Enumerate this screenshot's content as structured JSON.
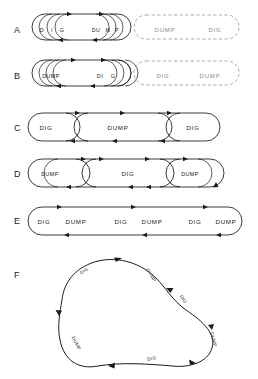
{
  "figure": {
    "background_color": "#ffffff",
    "ink_color": "#1a1a1a",
    "ghost_color": "#9a9a9a",
    "width": 258,
    "height": 379
  },
  "rows": [
    {
      "id": "A",
      "label": "A",
      "label_y": 30,
      "style": "nested-tight-with-ghost",
      "solid_labels": [
        {
          "text": "D",
          "x": 42,
          "y": 30
        },
        {
          "text": "I",
          "x": 52,
          "y": 30
        },
        {
          "text": "G",
          "x": 62,
          "y": 30
        },
        {
          "text": "DU",
          "x": 96,
          "y": 30
        },
        {
          "text": "M",
          "x": 108,
          "y": 30
        },
        {
          "text": "P",
          "x": 117,
          "y": 30
        }
      ],
      "ghost_labels": [
        {
          "text": "DUMP",
          "x": 143,
          "y": 30
        },
        {
          "text": "DIG",
          "x": 215,
          "y": 30
        }
      ]
    },
    {
      "id": "B",
      "label": "B",
      "label_y": 76,
      "style": "nested-tight-with-ghost",
      "solid_labels": [
        {
          "text": "DUMP",
          "x": 38,
          "y": 76
        },
        {
          "text": "DI",
          "x": 97,
          "y": 76
        },
        {
          "text": "G",
          "x": 112,
          "y": 76
        }
      ],
      "ghost_labels": [
        {
          "text": "DIG",
          "x": 143,
          "y": 76
        },
        {
          "text": "DUMP",
          "x": 205,
          "y": 76
        }
      ]
    },
    {
      "id": "C",
      "label": "C",
      "label_y": 128,
      "style": "nested-wide",
      "solid_labels": [
        {
          "text": "DIG",
          "x": 41,
          "y": 128
        },
        {
          "text": "DUMP",
          "x": 109,
          "y": 128
        },
        {
          "text": "DIG",
          "x": 189,
          "y": 128
        }
      ],
      "ghost_labels": []
    },
    {
      "id": "D",
      "label": "D",
      "label_y": 174,
      "style": "nested-wide",
      "solid_labels": [
        {
          "text": "DUMP",
          "x": 41,
          "y": 174
        },
        {
          "text": "DIG",
          "x": 112,
          "y": 174
        },
        {
          "text": "DUMP",
          "x": 182,
          "y": 174
        }
      ],
      "ghost_labels": []
    },
    {
      "id": "E",
      "label": "E",
      "label_y": 221,
      "style": "single-stadium",
      "solid_labels": [
        {
          "text": "DIG",
          "x": 38,
          "y": 221
        },
        {
          "text": "DUMP",
          "x": 69,
          "y": 221
        },
        {
          "text": "DIG",
          "x": 118,
          "y": 221
        },
        {
          "text": "DUMP",
          "x": 148,
          "y": 221
        },
        {
          "text": "DIG",
          "x": 193,
          "y": 221
        },
        {
          "text": "DUMP",
          "x": 222,
          "y": 221
        }
      ],
      "ghost_labels": []
    },
    {
      "id": "F",
      "label": "F",
      "label_y": 275,
      "style": "irregular-blob",
      "solid_labels": [],
      "ghost_labels": []
    }
  ],
  "blob_labels": [
    {
      "text": "DIG",
      "x": 85,
      "y": 272,
      "rotate": -34
    },
    {
      "text": "DUMP",
      "x": 147,
      "y": 273,
      "rotate": 58
    },
    {
      "text": "DIG",
      "x": 180,
      "y": 297,
      "rotate": 56
    },
    {
      "text": "DUMP",
      "x": 212,
      "y": 340,
      "rotate": 76
    },
    {
      "text": "DIG",
      "x": 152,
      "y": 359,
      "rotate": -12
    },
    {
      "text": "DUMP",
      "x": 73,
      "y": 344,
      "rotate": 62
    }
  ],
  "legend": {
    "solid_meaning": "actual traversed loop",
    "dashed_meaning": "projected or unexecuted loop"
  }
}
